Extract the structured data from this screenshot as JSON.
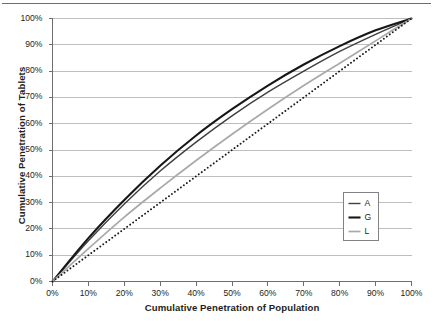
{
  "chart_data": {
    "type": "line",
    "title": "",
    "xlabel": "Cumulative Penetration of Population",
    "ylabel": "Cumulative Penetration of Tablets",
    "xlim": [
      0,
      100
    ],
    "ylim": [
      0,
      100
    ],
    "grid": true,
    "grid_axis": "y",
    "legend_position": "lower right",
    "x_ticks": [
      "0%",
      "10%",
      "20%",
      "30%",
      "40%",
      "50%",
      "60%",
      "70%",
      "80%",
      "90%",
      "100%"
    ],
    "y_ticks": [
      "0%",
      "10%",
      "20%",
      "30%",
      "40%",
      "50%",
      "60%",
      "70%",
      "80%",
      "90%",
      "100%"
    ],
    "x": [
      0,
      10,
      20,
      30,
      40,
      50,
      60,
      70,
      80,
      90,
      100
    ],
    "series": [
      {
        "name": "A",
        "label": "A",
        "color": "#3f3f3f",
        "width": 1.4,
        "dash": "none",
        "values": [
          0,
          15.5,
          29.5,
          42.0,
          53.0,
          63.0,
          72.0,
          80.0,
          87.5,
          94.0,
          100
        ]
      },
      {
        "name": "G",
        "label": "G",
        "color": "#171717",
        "width": 2.1,
        "dash": "none",
        "values": [
          0,
          16.5,
          31.0,
          44.0,
          55.5,
          65.5,
          74.5,
          82.5,
          89.5,
          95.5,
          100
        ]
      },
      {
        "name": "L",
        "label": "L",
        "color": "#a7a9ac",
        "width": 1.7,
        "dash": "none",
        "values": [
          0,
          12.5,
          24.5,
          35.5,
          46.0,
          56.0,
          65.5,
          74.5,
          83.0,
          91.5,
          100
        ]
      },
      {
        "name": "equality-reference",
        "label": "",
        "color": "#1a1a1a",
        "width": 1.9,
        "dash": "dotted",
        "in_legend": false,
        "values": [
          0,
          10,
          20,
          30,
          40,
          50,
          60,
          70,
          80,
          90,
          100
        ]
      }
    ],
    "legend_entries": [
      {
        "label": "A",
        "color": "#3f3f3f",
        "width": 1.4
      },
      {
        "label": "G",
        "color": "#171717",
        "width": 2.1
      },
      {
        "label": "L",
        "color": "#a7a9ac",
        "width": 1.7
      }
    ],
    "colors": {
      "axis": "#6d6e71",
      "grid": "#bcbec0",
      "text": "#231f20",
      "background": "#ffffff"
    }
  }
}
